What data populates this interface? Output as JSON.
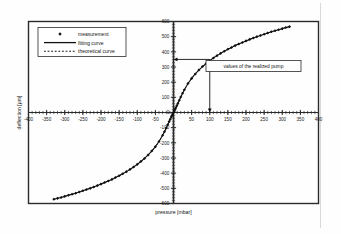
{
  "figure": {
    "background_color": "#fefefe",
    "frame_color": "#2b2b2b",
    "series_color": "#111111"
  },
  "chart_data": {
    "type": "scatter",
    "title": "",
    "xlabel": "pressure [mbar]",
    "ylabel": "deflection [µm]",
    "xlim": [
      -400,
      400
    ],
    "ylim": [
      -600,
      600
    ],
    "xticks": [
      -400,
      -350,
      -300,
      -250,
      -200,
      -150,
      -100,
      -50,
      0,
      50,
      100,
      150,
      200,
      250,
      300,
      350,
      400
    ],
    "yticks": [
      600,
      500,
      400,
      300,
      200,
      100,
      0,
      -100,
      -200,
      -300,
      -400,
      -500,
      -600
    ],
    "xtick_labels": [
      "-400",
      "-350",
      "-300",
      "-250",
      "-200",
      "-150",
      "-100",
      "-50",
      "0",
      "50",
      "100",
      "150",
      "200",
      "250",
      "300",
      "350",
      "400"
    ],
    "ytick_labels": [
      "600",
      "500",
      "400",
      "300",
      "200",
      "100",
      "0",
      "-100",
      "-200",
      "-300",
      "-400",
      "-500",
      "-600"
    ],
    "minor_tick_step": 10,
    "grid": false,
    "legend_position": "upper-left",
    "series": [
      {
        "name": "measurement",
        "marker": "diamond",
        "x": [
          -330,
          -320,
          -310,
          -300,
          -290,
          -280,
          -270,
          -260,
          -250,
          -240,
          -230,
          -220,
          -210,
          -200,
          -190,
          -180,
          -170,
          -160,
          -150,
          -140,
          -130,
          -120,
          -110,
          -100,
          -90,
          -80,
          -70,
          -60,
          -50,
          -40,
          -30,
          -25,
          -20,
          -16,
          -12,
          -9,
          -6,
          -4,
          -2,
          0,
          2,
          4,
          6,
          9,
          12,
          16,
          20,
          25,
          30,
          40,
          50,
          60,
          70,
          80,
          90,
          100,
          110,
          120,
          130,
          140,
          150,
          160,
          170,
          180,
          190,
          200,
          210,
          220,
          230,
          240,
          250,
          260,
          270,
          280,
          290,
          300,
          310,
          320
        ],
        "y": [
          -572,
          -566,
          -560,
          -553,
          -546,
          -539,
          -532,
          -524,
          -516,
          -508,
          -500,
          -491,
          -482,
          -472,
          -462,
          -452,
          -441,
          -429,
          -417,
          -404,
          -390,
          -375,
          -359,
          -342,
          -323,
          -303,
          -280,
          -254,
          -225,
          -191,
          -150,
          -127,
          -102,
          -81,
          -60,
          -44,
          -29,
          -19,
          -9,
          0,
          9,
          19,
          29,
          44,
          60,
          81,
          102,
          127,
          150,
          191,
          225,
          254,
          280,
          303,
          323,
          342,
          359,
          375,
          390,
          404,
          417,
          429,
          441,
          452,
          462,
          472,
          482,
          491,
          500,
          508,
          516,
          524,
          532,
          539,
          546,
          553,
          560,
          566
        ]
      },
      {
        "name": "fitting curve",
        "marker": "solid-line"
      },
      {
        "name": "theoretical curve",
        "marker": "dotted-line"
      }
    ],
    "annotations": [
      {
        "text": "values of the realized pump",
        "marker_x": 100,
        "marker_y": 350,
        "arrow_to_y_axis": true,
        "arrow_to_x_axis": true
      }
    ]
  },
  "legend": {
    "items": [
      {
        "label": "measurement",
        "style": "diamond"
      },
      {
        "label": "fitting curve",
        "style": "solid-line"
      },
      {
        "label": "theoretical curve",
        "style": "dotted-line"
      }
    ]
  }
}
